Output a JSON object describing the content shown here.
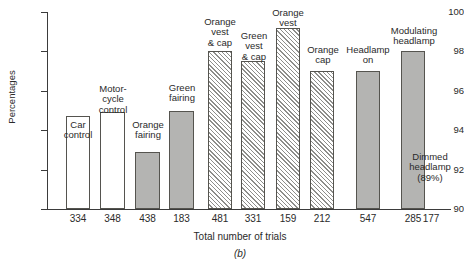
{
  "chart_data": {
    "type": "bar",
    "title": "",
    "xlabel": "Total number of trials",
    "ylabel": "Percentages",
    "ylim": [
      90,
      100
    ],
    "yticks": [
      90,
      92,
      94,
      96,
      98,
      100
    ],
    "grid": false,
    "legend": "none",
    "figure_label": "(b)",
    "categories": [
      "Car control",
      "Motor-cycle control",
      "Orange fairing",
      "Green fairing",
      "Orange vest & cap",
      "Green vest & cap",
      "Orange vest",
      "Orange cap",
      "Headlamp on",
      "Modulating headlamp",
      "Dimmed headlamp"
    ],
    "values": [
      94.7,
      94.9,
      92.9,
      95.0,
      98.0,
      97.5,
      99.2,
      97.0,
      97.0,
      98.0,
      89.0
    ],
    "trial_counts": [
      "334",
      "348",
      "438",
      "183",
      "481",
      "331",
      "159",
      "212",
      "547",
      "285",
      "177"
    ],
    "fills": [
      "hollow",
      "hollow",
      "solid",
      "solid",
      "hatch",
      "hatch",
      "hatch",
      "hatch",
      "solid",
      "solid",
      "none"
    ],
    "bars": [
      {
        "label": "Car\ncontrol",
        "value": 94.7,
        "trials": "334",
        "fill": "hollow",
        "x": 66,
        "w": 24,
        "caption_x": 56,
        "caption_y": 120,
        "caption_w": 44
      },
      {
        "label": "Motor-\ncycle\ncontrol",
        "value": 94.9,
        "trials": "348",
        "fill": "hollow",
        "x": 100,
        "w": 25,
        "caption_x": 88,
        "caption_y": 84,
        "caption_w": 50
      },
      {
        "label": "Orange\nfairing",
        "value": 92.9,
        "trials": "438",
        "fill": "solid",
        "x": 135,
        "w": 25,
        "caption_x": 123,
        "caption_y": 120,
        "caption_w": 50
      },
      {
        "label": "Green\nfairing",
        "value": 95.0,
        "trials": "183",
        "fill": "solid",
        "x": 169,
        "w": 25,
        "caption_x": 157,
        "caption_y": 83,
        "caption_w": 50
      },
      {
        "label": "Orange\nvest\n& cap",
        "value": 98.0,
        "trials": "481",
        "fill": "hatch",
        "x": 208,
        "w": 24,
        "caption_x": 195,
        "caption_y": 17,
        "caption_w": 50
      },
      {
        "label": "Green\nvest\n& cap",
        "value": 97.5,
        "trials": "331",
        "fill": "hatch",
        "x": 241,
        "w": 24,
        "caption_x": 229,
        "caption_y": 31,
        "caption_w": 50
      },
      {
        "label": "Orange\nvest",
        "value": 99.2,
        "trials": "159",
        "fill": "hatch",
        "x": 276,
        "w": 24,
        "caption_x": 263,
        "caption_y": 8,
        "caption_w": 50
      },
      {
        "label": "Orange\ncap",
        "value": 97.0,
        "trials": "212",
        "fill": "hatch",
        "x": 310,
        "w": 24,
        "caption_x": 298,
        "caption_y": 45,
        "caption_w": 50
      },
      {
        "label": "Headlamp\non",
        "value": 97.0,
        "trials": "547",
        "fill": "solid",
        "x": 356,
        "w": 24,
        "caption_x": 340,
        "caption_y": 45,
        "caption_w": 56
      },
      {
        "label": "Modulating\nheadlamp",
        "value": 98.0,
        "trials": "285",
        "fill": "solid",
        "x": 401,
        "w": 24,
        "caption_x": 383,
        "caption_y": 26,
        "caption_w": 62
      }
    ],
    "annotation": {
      "text": "Dimmed\nheadlamp\n(89%)",
      "trials": "177"
    }
  },
  "colors": {
    "axis": "#3b3b3b",
    "bar_outline": "#55544f",
    "bar_solid_fill": "#b4b4b2",
    "bar_hatch_line": "#8d8d8a",
    "background": "#ffffff",
    "text": "#2a2a2a"
  }
}
